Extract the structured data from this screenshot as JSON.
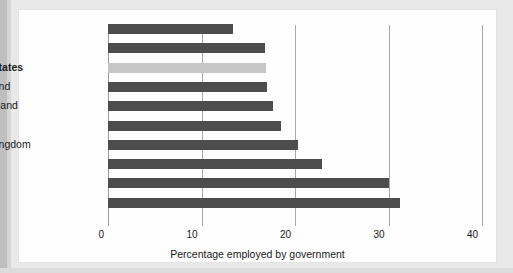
{
  "chart_data": {
    "type": "bar",
    "orientation": "horizontal",
    "title": "",
    "xlabel": "Percentage employed by government",
    "ylabel": "",
    "xlim": [
      0,
      40
    ],
    "xticks": [
      0,
      10,
      20,
      30,
      40
    ],
    "xtick_labels": [
      "0",
      "10",
      "20",
      "30",
      "40"
    ],
    "grid": true,
    "legend": false,
    "categories": [
      "Germany",
      "Australia",
      "United States",
      "Switzerland",
      "New Zealand",
      "Spain",
      "United Kingdom",
      "France",
      "Denmark",
      "Sweden"
    ],
    "values": [
      13.4,
      16.8,
      16.9,
      17.0,
      17.6,
      18.5,
      20.3,
      22.9,
      30.0,
      31.2
    ],
    "highlighted_category": "United States",
    "colors": {
      "bar": "#4d4d4d",
      "bar_highlight": "#c6c6c6",
      "gridline": "#a8a8a8",
      "text": "#1a1a1a",
      "panel_background": "#fefefe",
      "page_background": "#e9e9e9"
    }
  }
}
